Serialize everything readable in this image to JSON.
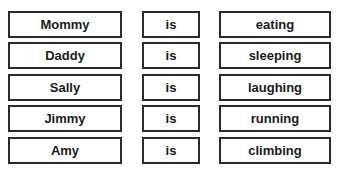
{
  "sentences": [
    {
      "subject": "Mommy",
      "verb": "is",
      "action": "eating"
    },
    {
      "subject": "Daddy",
      "verb": "is",
      "action": "sleeping"
    },
    {
      "subject": "Sally",
      "verb": "is",
      "action": "laughing"
    },
    {
      "subject": "Jimmy",
      "verb": "is",
      "action": "running"
    },
    {
      "subject": "Amy",
      "verb": "is",
      "action": "climbing"
    }
  ]
}
